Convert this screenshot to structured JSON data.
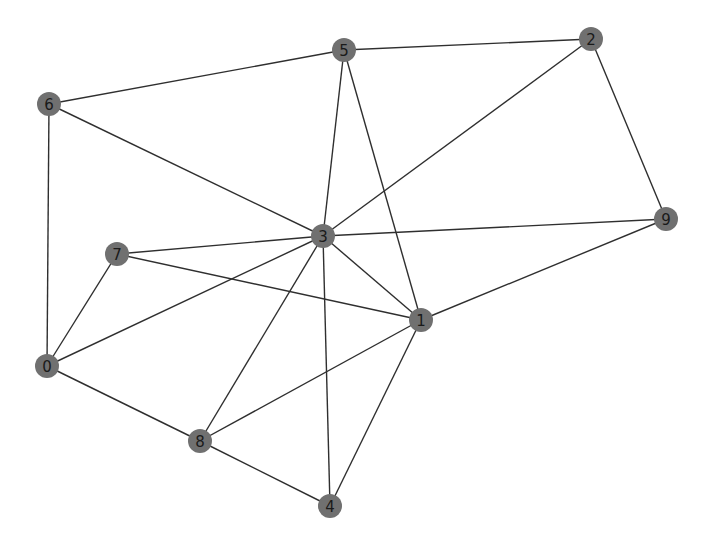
{
  "graph": {
    "type": "undirected-network",
    "node_color": "#707070",
    "edge_color": "#2f2f2f",
    "label_color": "#1a1a1a",
    "node_radius": 12,
    "nodes": [
      {
        "id": "0",
        "label": "0",
        "x": 47,
        "y": 366
      },
      {
        "id": "1",
        "label": "1",
        "x": 421,
        "y": 320
      },
      {
        "id": "2",
        "label": "2",
        "x": 591,
        "y": 39
      },
      {
        "id": "3",
        "label": "3",
        "x": 323,
        "y": 236
      },
      {
        "id": "4",
        "label": "4",
        "x": 330,
        "y": 506
      },
      {
        "id": "5",
        "label": "5",
        "x": 344,
        "y": 50
      },
      {
        "id": "6",
        "label": "6",
        "x": 49,
        "y": 104
      },
      {
        "id": "7",
        "label": "7",
        "x": 117,
        "y": 254
      },
      {
        "id": "8",
        "label": "8",
        "x": 200,
        "y": 441
      },
      {
        "id": "9",
        "label": "9",
        "x": 666,
        "y": 219
      }
    ],
    "edges": [
      [
        "0",
        "6"
      ],
      [
        "0",
        "7"
      ],
      [
        "0",
        "3"
      ],
      [
        "0",
        "8"
      ],
      [
        "1",
        "3"
      ],
      [
        "1",
        "5"
      ],
      [
        "1",
        "7"
      ],
      [
        "1",
        "9"
      ],
      [
        "1",
        "8"
      ],
      [
        "1",
        "4"
      ],
      [
        "2",
        "5"
      ],
      [
        "2",
        "3"
      ],
      [
        "2",
        "9"
      ],
      [
        "3",
        "5"
      ],
      [
        "3",
        "6"
      ],
      [
        "3",
        "7"
      ],
      [
        "3",
        "9"
      ],
      [
        "3",
        "8"
      ],
      [
        "3",
        "4"
      ],
      [
        "5",
        "6"
      ],
      [
        "8",
        "4"
      ]
    ]
  }
}
